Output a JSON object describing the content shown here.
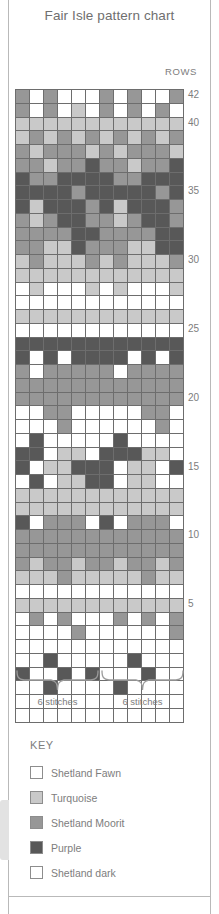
{
  "page": {
    "title": "Fair Isle pattern chart",
    "rows_caption": "ROWS",
    "key_title": "KEY"
  },
  "repeat": {
    "left_label": "6 stitches",
    "right_label": "6 stitches"
  },
  "key": {
    "items": [
      {
        "label": "Shetland Fawn",
        "color": "#ffffff",
        "class": "c0"
      },
      {
        "label": "Turquoise",
        "color": "#c9c9c9",
        "class": "c1"
      },
      {
        "label": "Shetland Moorit",
        "color": "#979797",
        "class": "c2"
      },
      {
        "label": "Purple",
        "color": "#585858",
        "class": "c3"
      },
      {
        "label": "Shetland dark",
        "color": "#ffffff",
        "class": "c4"
      }
    ]
  },
  "chart_data": {
    "type": "heatmap",
    "title": "Fair Isle pattern chart",
    "xlabel": "",
    "ylabel": "ROWS",
    "columns": 12,
    "rows": 42,
    "stitch_repeat": 6,
    "repeats": 2,
    "row_tick_labels": [
      42,
      40,
      35,
      30,
      25,
      20,
      15,
      10,
      5
    ],
    "palette": [
      "#ffffff",
      "#c9c9c9",
      "#979797",
      "#585858"
    ],
    "palette_names": [
      "Shetland Fawn",
      "Turquoise",
      "Shetland Moorit",
      "Purple"
    ],
    "row_order": "top_to_bottom_42_to_1",
    "grid": [
      [
        2,
        0,
        2,
        0,
        0,
        0,
        2,
        0,
        2,
        0,
        0,
        2
      ],
      [
        2,
        0,
        2,
        0,
        1,
        0,
        2,
        0,
        2,
        0,
        2,
        0
      ],
      [
        1,
        1,
        1,
        1,
        1,
        1,
        1,
        1,
        1,
        1,
        1,
        1
      ],
      [
        1,
        2,
        1,
        2,
        1,
        2,
        1,
        2,
        1,
        2,
        1,
        2
      ],
      [
        2,
        1,
        2,
        2,
        2,
        1,
        2,
        1,
        2,
        2,
        2,
        1
      ],
      [
        2,
        2,
        1,
        2,
        2,
        3,
        2,
        2,
        1,
        2,
        2,
        3
      ],
      [
        3,
        2,
        2,
        3,
        3,
        3,
        3,
        2,
        2,
        3,
        3,
        3
      ],
      [
        3,
        3,
        3,
        3,
        2,
        3,
        3,
        3,
        3,
        3,
        2,
        3
      ],
      [
        3,
        1,
        3,
        3,
        3,
        2,
        3,
        1,
        3,
        3,
        3,
        2
      ],
      [
        2,
        1,
        2,
        3,
        3,
        2,
        2,
        1,
        2,
        3,
        3,
        2
      ],
      [
        2,
        2,
        2,
        2,
        3,
        3,
        2,
        2,
        2,
        2,
        3,
        3
      ],
      [
        2,
        2,
        1,
        1,
        3,
        2,
        2,
        2,
        1,
        1,
        3,
        3
      ],
      [
        1,
        2,
        1,
        1,
        1,
        2,
        1,
        2,
        1,
        1,
        1,
        2
      ],
      [
        1,
        1,
        1,
        1,
        1,
        1,
        1,
        1,
        1,
        1,
        1,
        1
      ],
      [
        0,
        1,
        0,
        0,
        0,
        1,
        0,
        1,
        0,
        0,
        0,
        1
      ],
      [
        0,
        0,
        0,
        0,
        0,
        0,
        0,
        0,
        0,
        0,
        0,
        0
      ],
      [
        1,
        1,
        1,
        1,
        1,
        1,
        1,
        1,
        1,
        1,
        1,
        1
      ],
      [
        0,
        0,
        0,
        0,
        0,
        0,
        0,
        0,
        0,
        0,
        0,
        0
      ],
      [
        3,
        3,
        3,
        3,
        3,
        3,
        3,
        3,
        3,
        3,
        3,
        3
      ],
      [
        3,
        0,
        3,
        0,
        3,
        3,
        3,
        3,
        0,
        3,
        0,
        3
      ],
      [
        2,
        0,
        2,
        2,
        2,
        2,
        2,
        0,
        2,
        2,
        2,
        2
      ],
      [
        2,
        2,
        2,
        2,
        2,
        2,
        2,
        2,
        2,
        2,
        2,
        2
      ],
      [
        2,
        2,
        2,
        2,
        2,
        2,
        2,
        2,
        2,
        2,
        2,
        2
      ],
      [
        0,
        0,
        2,
        2,
        0,
        0,
        0,
        0,
        0,
        2,
        2,
        0
      ],
      [
        0,
        0,
        0,
        2,
        0,
        0,
        0,
        0,
        0,
        0,
        2,
        0
      ],
      [
        0,
        3,
        0,
        0,
        0,
        0,
        0,
        3,
        0,
        0,
        0,
        0
      ],
      [
        3,
        3,
        0,
        1,
        1,
        0,
        3,
        3,
        3,
        1,
        1,
        0
      ],
      [
        3,
        0,
        1,
        1,
        3,
        3,
        3,
        0,
        1,
        1,
        0,
        3
      ],
      [
        0,
        3,
        0,
        1,
        1,
        3,
        3,
        0,
        1,
        1,
        0,
        0
      ],
      [
        1,
        1,
        1,
        1,
        1,
        1,
        1,
        1,
        1,
        1,
        1,
        1
      ],
      [
        1,
        1,
        1,
        1,
        1,
        1,
        1,
        1,
        1,
        1,
        1,
        1
      ],
      [
        3,
        0,
        2,
        2,
        2,
        0,
        3,
        0,
        2,
        2,
        2,
        0
      ],
      [
        2,
        2,
        2,
        2,
        2,
        2,
        2,
        2,
        2,
        2,
        2,
        2
      ],
      [
        2,
        2,
        2,
        2,
        2,
        2,
        2,
        2,
        2,
        2,
        2,
        2
      ],
      [
        2,
        1,
        2,
        2,
        1,
        2,
        2,
        1,
        2,
        2,
        1,
        2
      ],
      [
        1,
        1,
        1,
        2,
        1,
        1,
        1,
        1,
        1,
        2,
        1,
        1
      ],
      [
        0,
        0,
        0,
        0,
        0,
        0,
        0,
        0,
        0,
        0,
        0,
        0
      ],
      [
        1,
        1,
        1,
        1,
        1,
        1,
        1,
        1,
        1,
        1,
        1,
        1
      ],
      [
        0,
        2,
        0,
        2,
        0,
        0,
        0,
        2,
        0,
        2,
        0,
        2
      ],
      [
        0,
        0,
        0,
        0,
        2,
        0,
        0,
        0,
        0,
        0,
        0,
        2
      ],
      [
        0,
        0,
        0,
        0,
        0,
        0,
        0,
        0,
        0,
        0,
        0,
        0
      ],
      [
        0,
        0,
        3,
        0,
        0,
        0,
        0,
        0,
        3,
        0,
        0,
        0
      ],
      [
        3,
        0,
        0,
        3,
        0,
        3,
        0,
        0,
        0,
        3,
        0,
        0
      ],
      [
        0,
        0,
        3,
        0,
        0,
        0,
        0,
        3,
        0,
        0,
        0,
        0
      ],
      [
        0,
        0,
        0,
        0,
        0,
        0,
        0,
        0,
        0,
        0,
        0,
        0
      ],
      [
        0,
        0,
        0,
        0,
        0,
        0,
        0,
        0,
        0,
        0,
        0,
        0
      ]
    ]
  }
}
